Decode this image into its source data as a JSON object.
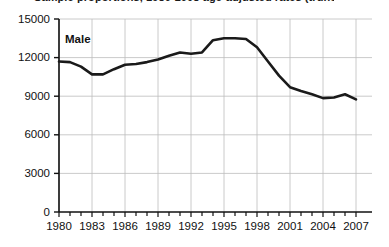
{
  "chart_data": {
    "type": "line",
    "title": "Sample proportions, 1980-2008 age-adjusted rates (truncated)",
    "xlabel": "",
    "ylabel": "",
    "xlim": [
      1980,
      2008
    ],
    "ylim": [
      0,
      15000
    ],
    "grid": true,
    "legend_position": "inline-label",
    "yticks": [
      0,
      3000,
      6000,
      9000,
      12000,
      15000
    ],
    "ytick_labels": [
      "0",
      "3000",
      "6000",
      "9000",
      "12000",
      "15000"
    ],
    "xticks": [
      1980,
      1981,
      1982,
      1983,
      1984,
      1985,
      1986,
      1987,
      1988,
      1989,
      1990,
      1991,
      1992,
      1993,
      1994,
      1995,
      1996,
      1997,
      1998,
      1999,
      2000,
      2001,
      2002,
      2003,
      2004,
      2005,
      2006,
      2007
    ],
    "xtick_labels": [
      "1980",
      "1983",
      "1986",
      "1989",
      "1992",
      "1995",
      "1998",
      "2001",
      "2004",
      "2007"
    ],
    "xtick_labeled_years": [
      1980,
      1983,
      1986,
      1989,
      1992,
      1995,
      1998,
      2001,
      2004,
      2007
    ],
    "series": [
      {
        "name": "Male",
        "color": "#1a1a1a",
        "annotation": "Male",
        "x": [
          1980,
          1981,
          1982,
          1983,
          1984,
          1985,
          1986,
          1987,
          1988,
          1989,
          1990,
          1991,
          1992,
          1993,
          1994,
          1995,
          1996,
          1997,
          1998,
          1999,
          2000,
          2001,
          2002,
          2003,
          2004,
          2005,
          2006,
          2007
        ],
        "values": [
          11700,
          11650,
          11300,
          10700,
          10700,
          11100,
          11450,
          11500,
          11650,
          11850,
          12150,
          12400,
          12300,
          12400,
          13350,
          13500,
          13500,
          13450,
          12800,
          11700,
          10600,
          9700,
          9400,
          9150,
          8850,
          8900,
          9150,
          8750
        ]
      }
    ]
  },
  "axis": {
    "y_axis_name": "y-axis",
    "x_axis_name": "x-axis"
  }
}
